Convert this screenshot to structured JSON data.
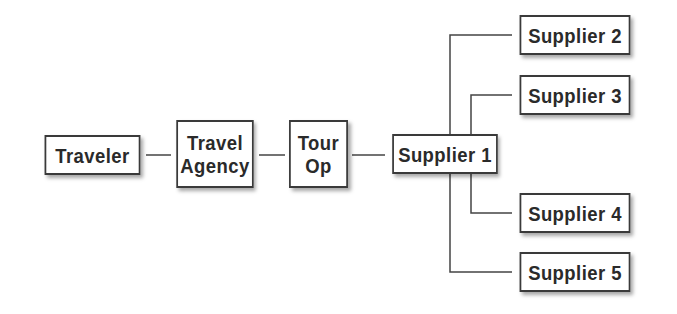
{
  "diagram": {
    "type": "flowchart",
    "nodes": [
      {
        "id": "traveler",
        "label": "Traveler"
      },
      {
        "id": "travel_agency",
        "label": "Travel\nAgency",
        "line1": "Travel",
        "line2": "Agency"
      },
      {
        "id": "tour_op",
        "label": "Tour\nOp",
        "line1": "Tour",
        "line2": "Op"
      },
      {
        "id": "supplier1",
        "label": "Supplier 1"
      },
      {
        "id": "supplier2",
        "label": "Supplier 2"
      },
      {
        "id": "supplier3",
        "label": "Supplier 3"
      },
      {
        "id": "supplier4",
        "label": "Supplier 4"
      },
      {
        "id": "supplier5",
        "label": "Supplier 5"
      }
    ],
    "edges": [
      {
        "from": "traveler",
        "to": "travel_agency"
      },
      {
        "from": "travel_agency",
        "to": "tour_op"
      },
      {
        "from": "tour_op",
        "to": "supplier1"
      },
      {
        "from": "supplier1",
        "to": "supplier2"
      },
      {
        "from": "supplier1",
        "to": "supplier3"
      },
      {
        "from": "supplier1",
        "to": "supplier4"
      },
      {
        "from": "supplier1",
        "to": "supplier5"
      }
    ],
    "colors": {
      "border": "#3a3a3a",
      "text": "#2a2a2a",
      "background": "#ffffff"
    }
  }
}
